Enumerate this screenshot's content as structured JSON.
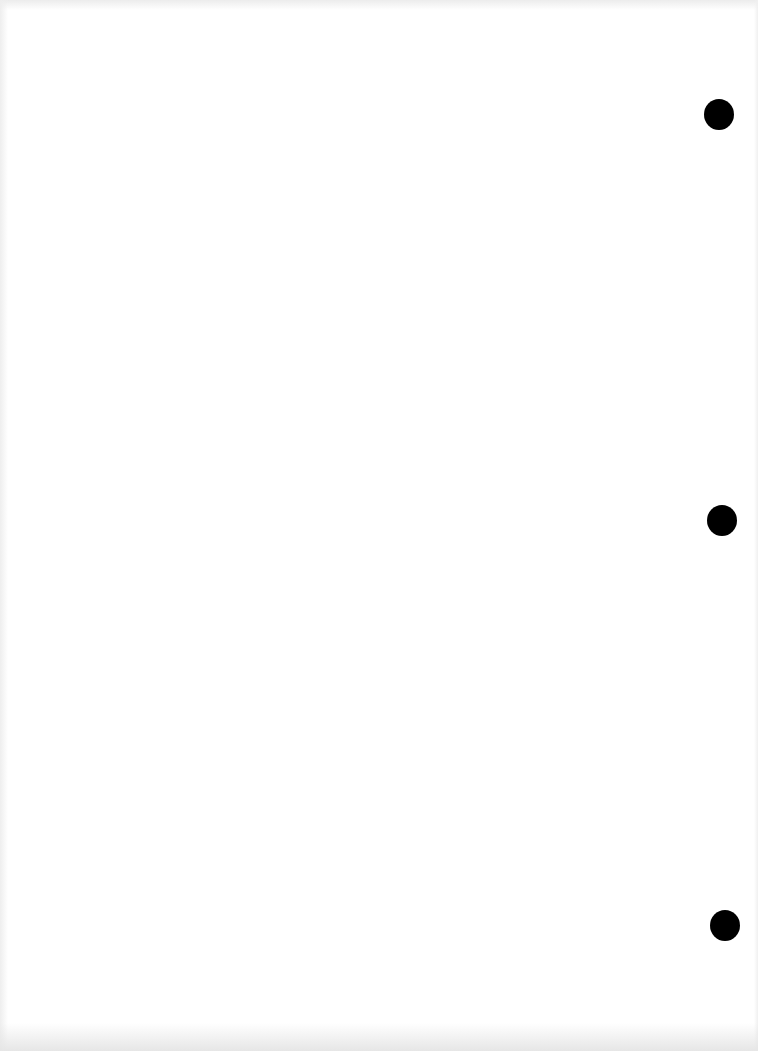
{
  "document": {
    "type": "scanned-blank-page",
    "background_color": "#ffffff",
    "text": "",
    "punch_holes": [
      {
        "x": 704,
        "y": 99,
        "diameter": 30
      },
      {
        "x": 707,
        "y": 505,
        "diameter": 30
      },
      {
        "x": 710,
        "y": 910,
        "diameter": 30
      }
    ],
    "hole_color": "#000000"
  }
}
